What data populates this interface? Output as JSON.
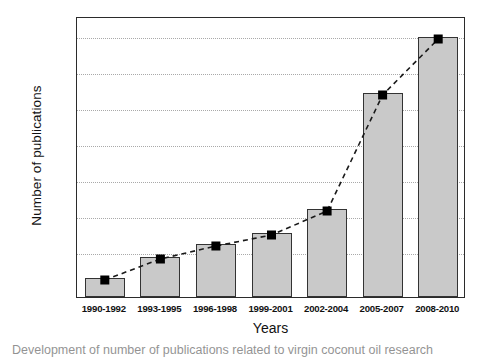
{
  "chart_data": {
    "type": "bar",
    "title": "",
    "xlabel": "Years",
    "ylabel": "Number of publications",
    "categories": [
      "1990-1992",
      "1993-1995",
      "1996-1998",
      "1999-2001",
      "2002-2004",
      "2005-2007",
      "2008-2010"
    ],
    "values": [
      19,
      40,
      53,
      64,
      88,
      204,
      260
    ],
    "ylim": [
      0,
      281
    ],
    "grid": true,
    "gridlines": 7,
    "legend": "none",
    "series": [
      {
        "name": "publications-bars",
        "type": "bar",
        "values": [
          19,
          40,
          53,
          64,
          88,
          204,
          260
        ]
      },
      {
        "name": "publications-trend",
        "type": "line",
        "style": "dashed",
        "marker": "square",
        "values": [
          19,
          40,
          53,
          64,
          88,
          204,
          260
        ]
      }
    ],
    "colors": {
      "bar_fill": "#c9c9c9",
      "bar_edge": "#333333",
      "line": "#1a1a1a",
      "marker": "#000000",
      "grid": "#a9a9a9",
      "frame": "#2b2b2b"
    }
  },
  "axes": {
    "y_title": "Number of publications",
    "x_title": "Years",
    "x_tick_labels": [
      "1990-1992",
      "1993-1995",
      "1996-1998",
      "1999-2001",
      "2002-2004",
      "2005-2007",
      "2008-2010"
    ],
    "y_tick_labels": []
  },
  "caption": {
    "text": "Development of number of publications related to virgin coconut oil research"
  }
}
